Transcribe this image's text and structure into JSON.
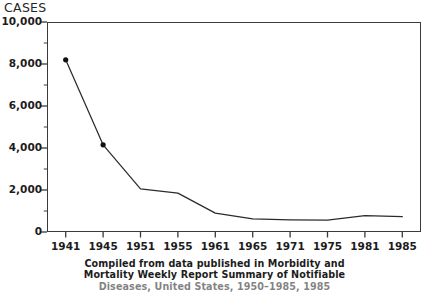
{
  "chart_data": {
    "type": "line",
    "title": "",
    "ylabel": "CASES",
    "xlabel": "",
    "x": [
      1941,
      1945,
      1951,
      1955,
      1961,
      1965,
      1971,
      1975,
      1981,
      1985
    ],
    "categories": [
      "1941",
      "1945",
      "1951",
      "1955",
      "1961",
      "1965",
      "1971",
      "1975",
      "1981",
      "1985"
    ],
    "values": [
      8200,
      4150,
      2050,
      1850,
      900,
      620,
      580,
      560,
      780,
      730
    ],
    "markers_at": [
      1941,
      1945
    ],
    "ylim": [
      0,
      10000
    ],
    "ytick_labels": [
      "0",
      "2,000",
      "4,000",
      "6,000",
      "8,000",
      "10,000"
    ],
    "ytick_values": [
      0,
      2000,
      4000,
      6000,
      8000,
      10000
    ],
    "yminor_step": 1000,
    "grid": false,
    "legend": false,
    "line_color": "#2b2b2b",
    "marker_color": "#111111",
    "frame_color": "#3a3a3a"
  },
  "axis": {
    "y_title": "CASES",
    "y_labels": [
      "10,000",
      "8,000",
      "6,000",
      "4,000",
      "2,000",
      "0"
    ],
    "x_labels": [
      "1941",
      "1945",
      "1951",
      "1955",
      "1961",
      "1965",
      "1971",
      "1975",
      "1981",
      "1985"
    ]
  },
  "caption": {
    "line1": "Compiled from data published in Morbidity and",
    "line2": "Mortality Weekly Report Summary of Notifiable",
    "line3": "Diseases, United States, 1950–1985, 1985"
  }
}
